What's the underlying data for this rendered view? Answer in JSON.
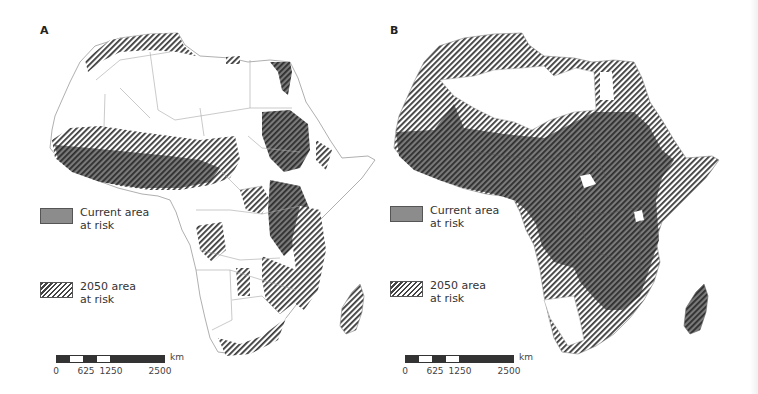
{
  "figure": {
    "panels": [
      {
        "id": "A",
        "label": "A",
        "description": "Africa map: current area at risk (solid gray) and 2050 area at risk (hatched)",
        "legend": [
          {
            "type": "current",
            "text_line1": "Current area",
            "text_line2": "at risk",
            "color": "#8c8c8c"
          },
          {
            "type": "2050",
            "text_line1": "2050 area",
            "text_line2": "at risk",
            "pattern": "diagonal-hatch"
          }
        ],
        "scale": {
          "ticks": [
            "0",
            "625",
            "1250",
            "2500"
          ],
          "unit": "km"
        }
      },
      {
        "id": "B",
        "label": "B",
        "description": "Africa map: current area at risk (solid gray) and 2050 area at risk (hatched), larger extent",
        "legend": [
          {
            "type": "current",
            "text_line1": "Current area",
            "text_line2": "at risk",
            "color": "#8c8c8c"
          },
          {
            "type": "2050",
            "text_line1": "2050 area",
            "text_line2": "at risk",
            "pattern": "diagonal-hatch"
          }
        ],
        "scale": {
          "ticks": [
            "0",
            "625",
            "1250",
            "2500"
          ],
          "unit": "km"
        }
      }
    ],
    "colors": {
      "current_risk": "#6e6e6e",
      "hatch_line": "#3a3a3a",
      "border": "#9a9a9a",
      "land": "#ffffff"
    }
  }
}
